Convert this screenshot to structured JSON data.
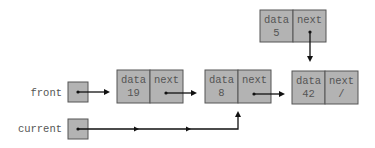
{
  "variables": [
    {
      "name": "front",
      "label": "front"
    },
    {
      "name": "current",
      "label": "current"
    }
  ],
  "nodes": [
    {
      "id": "n19",
      "data_label": "data",
      "next_label": "next",
      "data": "19",
      "next": "•"
    },
    {
      "id": "n8",
      "data_label": "data",
      "next_label": "next",
      "data": "8",
      "next": "•"
    },
    {
      "id": "n42",
      "data_label": "data",
      "next_label": "next",
      "data": "42",
      "next": "/"
    },
    {
      "id": "n5",
      "data_label": "data",
      "next_label": "next",
      "data": "5",
      "next": "•"
    }
  ],
  "links": [
    {
      "from": "front",
      "to": "n19"
    },
    {
      "from": "n19.next",
      "to": "n8"
    },
    {
      "from": "n8.next",
      "to": "n42"
    },
    {
      "from": "n5.next",
      "to": "n42"
    },
    {
      "from": "current",
      "to": "n8"
    }
  ]
}
